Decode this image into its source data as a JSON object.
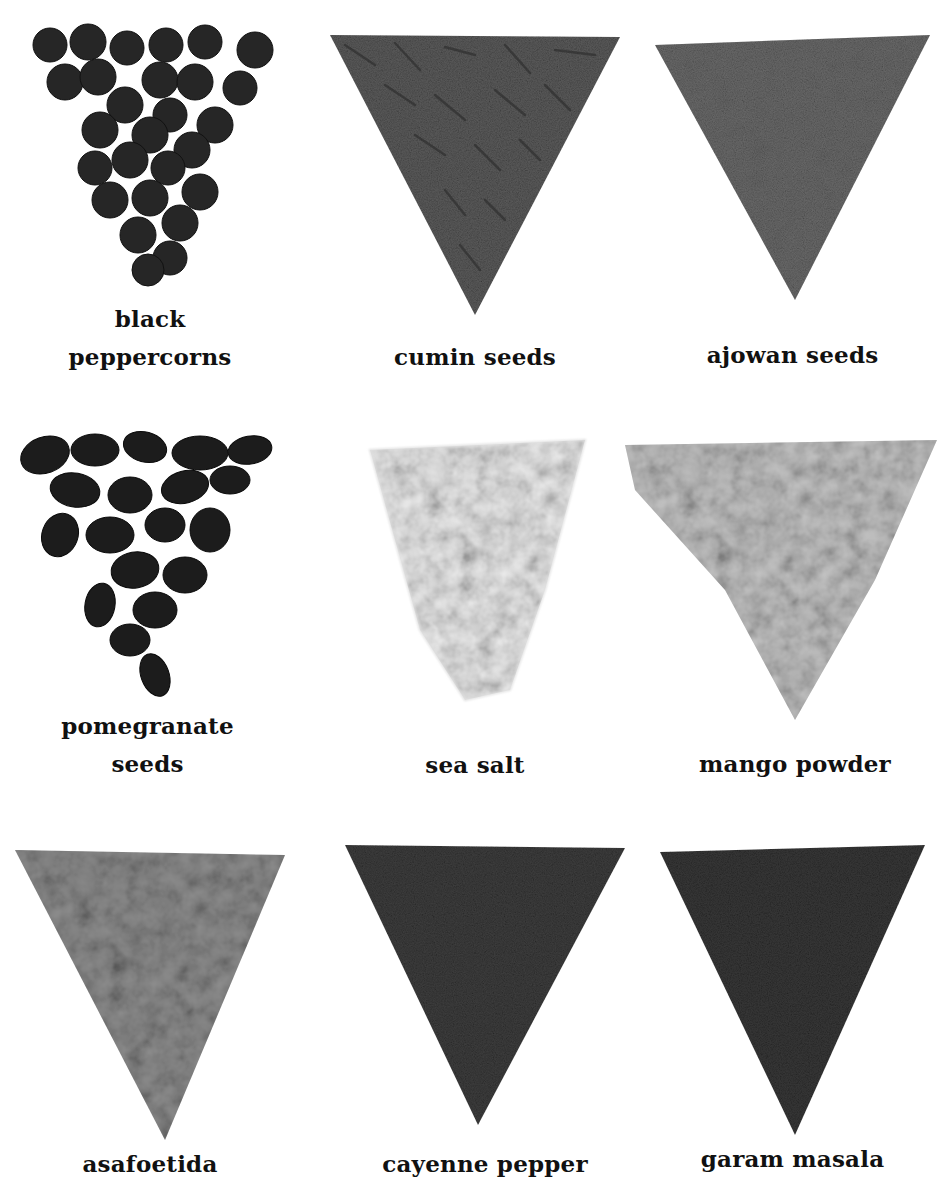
{
  "page": {
    "background": "#ffffff",
    "layout": "3x3 grid of spice swatches with captions"
  },
  "spices": [
    {
      "id": "black-peppercorns",
      "label_lines": [
        "black",
        "peppercorns"
      ],
      "texture": "round-peppercorns",
      "tone": "#2b2b2b"
    },
    {
      "id": "cumin-seeds",
      "label_lines": [
        "cumin seeds"
      ],
      "texture": "elongated-seeds",
      "tone": "#5a5a5a"
    },
    {
      "id": "ajowan-seeds",
      "label_lines": [
        "ajowan seeds"
      ],
      "texture": "small-seeds",
      "tone": "#6e6e6e"
    },
    {
      "id": "pomegranate-seeds",
      "label_lines": [
        "pomegranate",
        "seeds"
      ],
      "texture": "dark-chunks",
      "tone": "#1e1e1e"
    },
    {
      "id": "sea-salt",
      "label_lines": [
        "sea salt"
      ],
      "texture": "pale-crystals",
      "tone": "#e6e6e6"
    },
    {
      "id": "mango-powder",
      "label_lines": [
        "mango powder"
      ],
      "texture": "light-powder",
      "tone": "#bdbdbd"
    },
    {
      "id": "asafoetida",
      "label_lines": [
        "asafoetida"
      ],
      "texture": "coarse-powder",
      "tone": "#8c8c8c"
    },
    {
      "id": "cayenne-pepper",
      "label_lines": [
        "cayenne pepper"
      ],
      "texture": "fine-powder",
      "tone": "#3c3c3c"
    },
    {
      "id": "garam-masala",
      "label_lines": [
        "garam masala"
      ],
      "texture": "fine-powder",
      "tone": "#353535"
    }
  ]
}
